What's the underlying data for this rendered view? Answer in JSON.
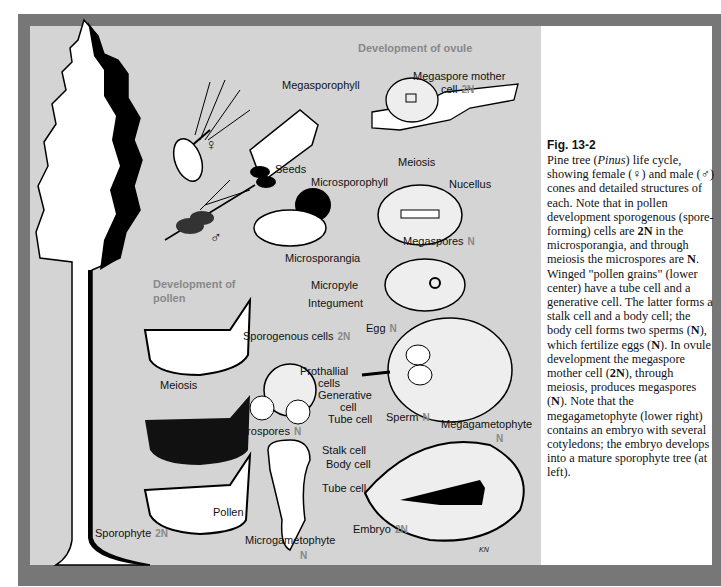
{
  "figure": {
    "number": "Fig. 13-2",
    "caption_parts": {
      "p1": "Pine tree (",
      "genus": "Pinus",
      "p2": ") life cycle, showing female (♀) and male (♂) cones and detailed structures of each. Note that in pollen development sporogenous (spore-forming) cells are ",
      "b1": "2N",
      "p3": " in the microsporangia, and through meiosis the microspores are ",
      "b2": "N",
      "p4": ". Winged \"pollen grains\" (lower center) have a tube cell and a generative cell. The latter forms a stalk cell and a body cell; the body cell forms two sperms (",
      "b3": "N",
      "p5": "), which fertilize eggs (",
      "b4": "N",
      "p6": "). In ovule development the megaspore mother cell (",
      "b5": "2N",
      "p7": "), through meiosis, produces megaspores (",
      "b6": "N",
      "p8": "). Note that the megagametophyte (lower right) contains an embryo with several cotyledons; the embryo develops into a mature sporophyte tree (at left)."
    }
  },
  "sections": {
    "ovule": "Development of ovule",
    "pollen_line1": "Development of",
    "pollen_line2": "pollen"
  },
  "symbols": {
    "female": "♀",
    "male": "♂"
  },
  "labels": {
    "megasporophyll": "Megasporophyll",
    "seeds": "Seeds",
    "megaspore_mother_1": "Megaspore mother",
    "megaspore_mother_2": "cell",
    "megaspore_mother_ploidy": "2N",
    "meiosis_ovule": "Meiosis",
    "nucellus": "Nucellus",
    "microsporophyll": "Microsporophyll",
    "microsporangia": "Microsporangia",
    "megaspores": "Megaspores",
    "megaspores_ploidy": "N",
    "micropyle": "Micropyle",
    "integument": "Integument",
    "egg": "Egg",
    "egg_ploidy": "N",
    "sporogenous": "Sporogenous cells",
    "sporogenous_ploidy": "2N",
    "meiosis_pollen": "Meiosis",
    "prothallial_1": "Prothallial",
    "prothallial_2": "cells",
    "generative_1": "Generative",
    "generative_2": "cell",
    "tube_cell_1": "Tube cell",
    "sperm": "Sperm",
    "sperm_ploidy": "N",
    "megagametophyte": "Megagametophyte",
    "megagametophyte_ploidy": "N",
    "microspores": "Microspores",
    "microspores_ploidy": "N",
    "stalk_cell": "Stalk cell",
    "body_cell": "Body cell",
    "tube_cell_2": "Tube cell",
    "pollen": "Pollen",
    "embryo": "Embryo",
    "embryo_ploidy": "2N",
    "sporophyte": "Sporophyte",
    "sporophyte_ploidy": "2N",
    "microgametophyte": "Microgametophyte",
    "microgametophyte_ploidy": "N",
    "signature": "KN"
  },
  "colors": {
    "frame": "#777777",
    "panel": "#d4d4d4",
    "ploidy": "#888888"
  }
}
